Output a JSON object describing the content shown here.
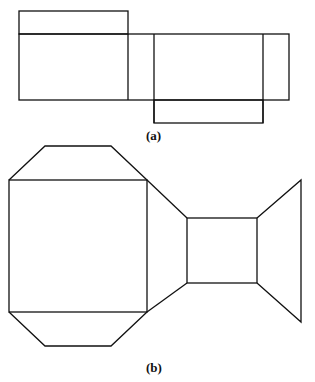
{
  "figure_a": {
    "caption": "(a)",
    "description": "Net of a rectangular box (cuboid)",
    "stroke": "#111111"
  },
  "figure_b": {
    "caption": "(b)",
    "description": "Net of a shape with square faces joined by trapezoids",
    "stroke": "#111111"
  }
}
